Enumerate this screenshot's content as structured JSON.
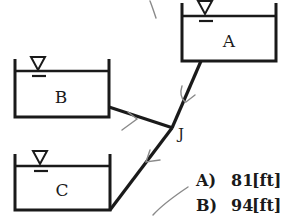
{
  "diagram": {
    "type": "three-reservoir pipe network",
    "colors": {
      "ink": "#1a1a1a",
      "pencil": "#8a8a8a",
      "background": "#ffffff"
    },
    "reservoirs": [
      {
        "label": "A",
        "icon": "water-level-triangle-icon"
      },
      {
        "label": "B",
        "icon": "water-level-triangle-icon"
      },
      {
        "label": "C",
        "icon": "water-level-triangle-icon"
      }
    ],
    "junction": {
      "label": "J"
    },
    "pipes": [
      {
        "from": "A",
        "to": "J"
      },
      {
        "from": "B",
        "to": "J"
      },
      {
        "from": "J",
        "to": "C"
      }
    ],
    "answers": [
      {
        "letter": "A)",
        "value": "81",
        "unit": "[ft]"
      },
      {
        "letter": "B)",
        "value": "94",
        "unit": "[ft]"
      }
    ]
  }
}
